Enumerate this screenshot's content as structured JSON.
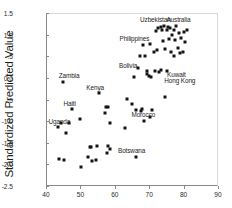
{
  "chart_data": {
    "type": "scatter",
    "title": "",
    "xlabel": "",
    "ylabel": "Standardized Predicted Value",
    "xlim": [
      40,
      90
    ],
    "ylim": [
      -2.5,
      1.5
    ],
    "xticks": [
      "40",
      "50",
      "60",
      "70",
      "80",
      "90"
    ],
    "xtick_values": [
      40,
      50,
      60,
      70,
      80,
      90
    ],
    "yticks": [
      "1.5",
      "1.0",
      ".5",
      "0.0",
      "-.5",
      "-1.0",
      "-1.5",
      "-2.0",
      "-2.5"
    ],
    "ytick_values": [
      1.5,
      1.0,
      0.5,
      0.0,
      -0.5,
      -1.0,
      -1.5,
      -2.0,
      -2.5
    ],
    "grid": false,
    "legend": false,
    "marker": "square",
    "marker_color": "#141414",
    "points": [
      {
        "x": 43.2,
        "y": -1.12
      },
      {
        "x": 43.6,
        "y": -1.85
      },
      {
        "x": 44.0,
        "y": -1.02
      },
      {
        "x": 44.6,
        "y": -0.07
      },
      {
        "x": 44.8,
        "y": -1.87
      },
      {
        "x": 45.4,
        "y": -1.25
      },
      {
        "x": 46.4,
        "y": -1.01
      },
      {
        "x": 47.2,
        "y": -0.69
      },
      {
        "x": 49.6,
        "y": -0.93
      },
      {
        "x": 50.0,
        "y": -2.04
      },
      {
        "x": 52.0,
        "y": -1.8
      },
      {
        "x": 52.4,
        "y": -1.57
      },
      {
        "x": 52.8,
        "y": -1.57
      },
      {
        "x": 53.0,
        "y": -1.9
      },
      {
        "x": 54.2,
        "y": -1.88
      },
      {
        "x": 54.6,
        "y": -1.56
      },
      {
        "x": 55.0,
        "y": -0.32
      },
      {
        "x": 56.8,
        "y": -0.8
      },
      {
        "x": 57.2,
        "y": -0.64
      },
      {
        "x": 57.4,
        "y": -1.71
      },
      {
        "x": 57.6,
        "y": -0.65
      },
      {
        "x": 57.8,
        "y": -1.55
      },
      {
        "x": 58.2,
        "y": -1.01
      },
      {
        "x": 58.4,
        "y": -1.62
      },
      {
        "x": 62.8,
        "y": -1.14
      },
      {
        "x": 63.4,
        "y": -0.47
      },
      {
        "x": 64.6,
        "y": -0.59
      },
      {
        "x": 65.4,
        "y": 0.05
      },
      {
        "x": 65.8,
        "y": -1.8
      },
      {
        "x": 66.0,
        "y": -0.71
      },
      {
        "x": 66.4,
        "y": 0.26
      },
      {
        "x": 67.0,
        "y": 0.53
      },
      {
        "x": 67.4,
        "y": -0.74
      },
      {
        "x": 67.6,
        "y": -0.7
      },
      {
        "x": 67.8,
        "y": 0.78
      },
      {
        "x": 68.2,
        "y": -0.98
      },
      {
        "x": 68.6,
        "y": 0.54
      },
      {
        "x": 69.0,
        "y": 0.19
      },
      {
        "x": 69.2,
        "y": 0.11
      },
      {
        "x": 69.6,
        "y": 0.07
      },
      {
        "x": 69.8,
        "y": -0.89
      },
      {
        "x": 70.0,
        "y": 0.81
      },
      {
        "x": 70.2,
        "y": 0.05
      },
      {
        "x": 70.6,
        "y": -0.72
      },
      {
        "x": 71.0,
        "y": 0.62
      },
      {
        "x": 71.4,
        "y": 0.18
      },
      {
        "x": 71.8,
        "y": 1.11
      },
      {
        "x": 72.0,
        "y": 0.66
      },
      {
        "x": 72.4,
        "y": 1.18
      },
      {
        "x": 72.6,
        "y": 0.16
      },
      {
        "x": 73.0,
        "y": 1.2
      },
      {
        "x": 73.2,
        "y": 0.2
      },
      {
        "x": 73.4,
        "y": 1.14
      },
      {
        "x": 73.8,
        "y": 0.88
      },
      {
        "x": 74.0,
        "y": 1.22
      },
      {
        "x": 74.2,
        "y": -0.41
      },
      {
        "x": 74.4,
        "y": 0.69
      },
      {
        "x": 74.8,
        "y": 1.13
      },
      {
        "x": 75.0,
        "y": 0.19
      },
      {
        "x": 75.2,
        "y": 1.2
      },
      {
        "x": 75.6,
        "y": 0.92
      },
      {
        "x": 75.8,
        "y": 1.17
      },
      {
        "x": 76.0,
        "y": 0.61
      },
      {
        "x": 76.4,
        "y": 1.02
      },
      {
        "x": 76.8,
        "y": 1.14
      },
      {
        "x": 77.0,
        "y": 0.54
      },
      {
        "x": 77.2,
        "y": 0.9
      },
      {
        "x": 77.6,
        "y": 1.22
      },
      {
        "x": 78.0,
        "y": 0.72
      },
      {
        "x": 78.4,
        "y": 1.05
      },
      {
        "x": 78.6,
        "y": 0.6
      },
      {
        "x": 79.0,
        "y": 0.95
      },
      {
        "x": 79.4,
        "y": 0.62
      },
      {
        "x": 79.8,
        "y": 1.08
      },
      {
        "x": 80.2,
        "y": 0.85
      },
      {
        "x": 80.6,
        "y": 1.12
      }
    ],
    "annotations": [
      {
        "text": "Uzbekistan",
        "x": 71.5,
        "y": 1.36
      },
      {
        "text": "Australia",
        "x": 78.2,
        "y": 1.36
      },
      {
        "text": "Philippines",
        "x": 65.4,
        "y": 0.93
      },
      {
        "text": "Bolivia",
        "x": 63.6,
        "y": 0.3
      },
      {
        "text": "Kuwait",
        "x": 77.6,
        "y": 0.1
      },
      {
        "text": "Hong Kong",
        "x": 78.6,
        "y": -0.05
      },
      {
        "text": "Zambia",
        "x": 46.4,
        "y": 0.06
      },
      {
        "text": "Kenya",
        "x": 54.0,
        "y": -0.2
      },
      {
        "text": "Haiti",
        "x": 46.6,
        "y": -0.57
      },
      {
        "text": "Uganda",
        "x": 43.6,
        "y": -0.99
      },
      {
        "text": "Morocco",
        "x": 68.0,
        "y": -0.84
      },
      {
        "text": "Botswana",
        "x": 64.6,
        "y": -1.67
      }
    ]
  }
}
